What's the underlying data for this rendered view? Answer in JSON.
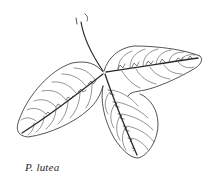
{
  "figure": {
    "caption": "P. lutea",
    "line_color": "#2a2a2a",
    "background": "#ffffff"
  }
}
